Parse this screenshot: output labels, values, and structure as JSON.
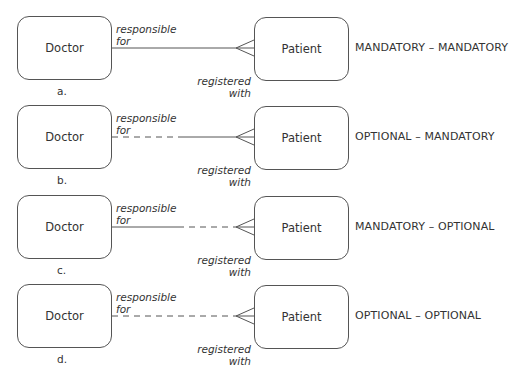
{
  "diagram": {
    "type": "entity-relationship cardinality/optionality examples",
    "rows": [
      {
        "id": "a",
        "letter": "a.",
        "left_entity": "Doctor",
        "right_entity": "Patient",
        "left_role": "responsible for",
        "right_role": "registered with",
        "left_role_lines": [
          "responsible",
          "for"
        ],
        "right_role_lines": [
          "registered",
          "with"
        ],
        "left_half": "solid",
        "right_half": "solid",
        "caption": "MANDATORY – MANDATORY"
      },
      {
        "id": "b",
        "letter": "b.",
        "left_entity": "Doctor",
        "right_entity": "Patient",
        "left_role": "responsible for",
        "right_role": "registered with",
        "left_role_lines": [
          "responsible",
          "for"
        ],
        "right_role_lines": [
          "registered",
          "with"
        ],
        "left_half": "dashed",
        "right_half": "solid",
        "caption": "OPTIONAL – MANDATORY"
      },
      {
        "id": "c",
        "letter": "c.",
        "left_entity": "Doctor",
        "right_entity": "Patient",
        "left_role": "responsible for",
        "right_role": "registered with",
        "left_role_lines": [
          "responsible",
          "for"
        ],
        "right_role_lines": [
          "registered",
          "with"
        ],
        "left_half": "solid",
        "right_half": "dashed",
        "caption": "MANDATORY – OPTIONAL"
      },
      {
        "id": "d",
        "letter": "d.",
        "left_entity": "Doctor",
        "right_entity": "Patient",
        "left_role": "responsible for",
        "right_role": "registered with",
        "left_role_lines": [
          "responsible",
          "for"
        ],
        "right_role_lines": [
          "registered",
          "with"
        ],
        "left_half": "dashed",
        "right_half": "dashed",
        "caption": "OPTIONAL – OPTIONAL"
      }
    ],
    "colors": {
      "line": "#555555",
      "text": "#333333",
      "background": "#ffffff"
    },
    "notation": {
      "many_end": "crow's foot at Patient",
      "one_end": "Doctor"
    }
  }
}
